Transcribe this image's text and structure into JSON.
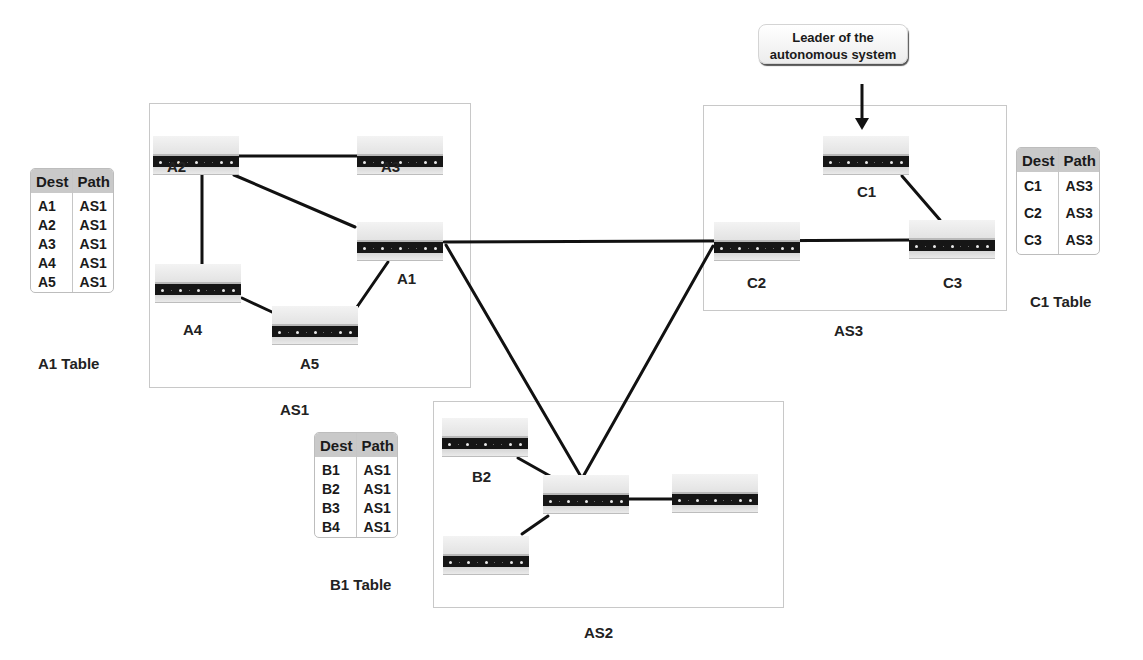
{
  "callout": {
    "line1": "Leader of the",
    "line2": "autonomous system"
  },
  "autonomous_systems": [
    {
      "id": "AS1",
      "label": "AS1"
    },
    {
      "id": "AS2",
      "label": "AS2"
    },
    {
      "id": "AS3",
      "label": "AS3"
    }
  ],
  "routers": {
    "A1": {
      "label": "A1",
      "as": "AS1"
    },
    "A2": {
      "label": "A2",
      "as": "AS1"
    },
    "A3": {
      "label": "A3",
      "as": "AS1"
    },
    "A4": {
      "label": "A4",
      "as": "AS1"
    },
    "A5": {
      "label": "A5",
      "as": "AS1"
    },
    "B1": {
      "label": "",
      "as": "AS2"
    },
    "B2": {
      "label": "B2",
      "as": "AS2"
    },
    "B3": {
      "label": "",
      "as": "AS2"
    },
    "B4": {
      "label": "",
      "as": "AS2"
    },
    "C1": {
      "label": "C1",
      "as": "AS3",
      "leader": true
    },
    "C2": {
      "label": "C2",
      "as": "AS3"
    },
    "C3": {
      "label": "C3",
      "as": "AS3"
    }
  },
  "links": [
    [
      "A2",
      "A3"
    ],
    [
      "A2",
      "A1"
    ],
    [
      "A2",
      "A4"
    ],
    [
      "A4",
      "A5"
    ],
    [
      "A5",
      "A1"
    ],
    [
      "A1",
      "C2"
    ],
    [
      "A1",
      "B1"
    ],
    [
      "C2",
      "B1"
    ],
    [
      "C2",
      "C3"
    ],
    [
      "C1",
      "C3"
    ],
    [
      "B2",
      "B1"
    ],
    [
      "B3",
      "B1"
    ],
    [
      "B1",
      "B4"
    ]
  ],
  "tables": {
    "A1": {
      "caption": "A1 Table",
      "headers": [
        "Dest",
        "Path"
      ],
      "rows": [
        [
          "A1",
          "AS1"
        ],
        [
          "A2",
          "AS1"
        ],
        [
          "A3",
          "AS1"
        ],
        [
          "A4",
          "AS1"
        ],
        [
          "A5",
          "AS1"
        ]
      ]
    },
    "B1": {
      "caption": "B1 Table",
      "headers": [
        "Dest",
        "Path"
      ],
      "rows": [
        [
          "B1",
          "AS1"
        ],
        [
          "B2",
          "AS1"
        ],
        [
          "B3",
          "AS1"
        ],
        [
          "B4",
          "AS1"
        ]
      ]
    },
    "C1": {
      "caption": "C1 Table",
      "headers": [
        "Dest",
        "Path"
      ],
      "rows": [
        [
          "C1",
          "AS3"
        ],
        [
          "C2",
          "AS3"
        ],
        [
          "C3",
          "AS3"
        ]
      ]
    }
  }
}
